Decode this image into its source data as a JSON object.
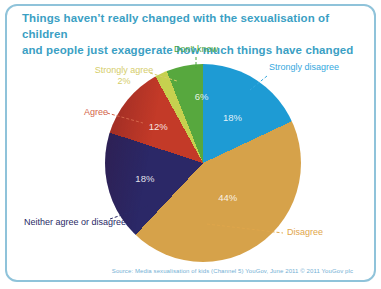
{
  "card": {
    "title_line1": "Things haven’t really changed with the sexualisation of children",
    "title_line2": "and people just exaggerate how much things have changed",
    "source": "Source: Media sexualisation of kids (Channel 5) YouGov, June 2011 © 2011 YouGov plc"
  },
  "colors": {
    "card_border": "#8fc3da",
    "title_text": "#3b9fc4",
    "source_text": "#74b0d4"
  },
  "chart_data": {
    "type": "pie",
    "title": "Things haven’t really changed with the sexualisation of children and people just exaggerate how much things have changed",
    "direction": "clockwise",
    "start_angle_deg": 0,
    "legend_position": "around-pie",
    "slices": [
      {
        "label": "Strongly disagree",
        "value": 18,
        "pct_label": "18%",
        "color": "#1e9bd4",
        "label_color": "#35a8de",
        "label_r": 55
      },
      {
        "label": "Disagree",
        "value": 44,
        "pct_label": "44%",
        "color": "#d6a24a",
        "label_color": "#dfa64b",
        "label_r": 42
      },
      {
        "label": "Neither agree or disagree",
        "value": 18,
        "pct_label": "18%",
        "color": "#2b2867",
        "label_color": "#2a2a66",
        "label_r": 60
      },
      {
        "label": "Agree",
        "value": 12,
        "pct_label": "12%",
        "color": "#c33a28",
        "label_color": "#d4654a",
        "label_r": 58
      },
      {
        "label": "Strongly agree",
        "value": 2,
        "pct_label": "2%",
        "color": "#c6d14f",
        "label_color": "#d5cd6a",
        "pct_outside": true
      },
      {
        "label": "Don't know",
        "value": 6,
        "pct_label": "6%",
        "color": "#57a83e",
        "label_color": "#4aa53c",
        "label_r": 72,
        "label_dx": 12,
        "label_dy": 4
      }
    ]
  }
}
